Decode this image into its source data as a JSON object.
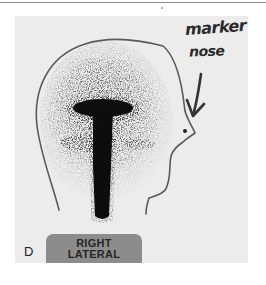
{
  "figure": {
    "panel_label": "D",
    "view_badge": {
      "line1": "RIGHT",
      "line2": "LATERAL"
    },
    "annotation": {
      "line1": "marker",
      "line2": "nose",
      "pointer_icon": "arrow-down-icon"
    },
    "colors": {
      "background": "#ececec",
      "outline": "#5a5a5a",
      "uptake": "#0d0d0d",
      "badge": "#8c8c8c"
    }
  }
}
